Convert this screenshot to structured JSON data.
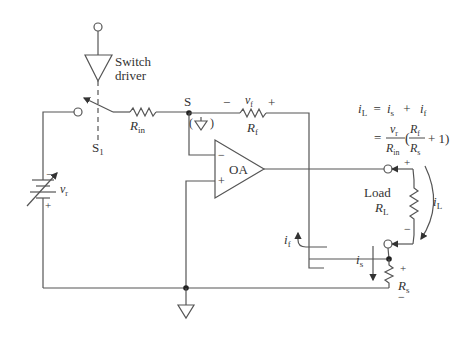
{
  "diagram": {
    "type": "circuit",
    "labels": {
      "switch_driver_line1": "Switch",
      "switch_driver_line2": "driver",
      "switch_name": "S",
      "switch_sub": "1",
      "rin": "R",
      "rin_sub": "in",
      "node_s": "S",
      "virtual_ground": "( ▽ )",
      "vf": "v",
      "vf_sub": "f",
      "vf_minus": "−",
      "vf_plus": "+",
      "rf": "R",
      "rf_sub": "f",
      "opamp": "OA",
      "opamp_minus": "−",
      "opamp_plus": "+",
      "source_v": "v",
      "source_sub": "r",
      "source_minus": "−",
      "source_plus": "+",
      "load_line1": "Load",
      "load_r": "R",
      "load_sub": "L",
      "load_plus": "+",
      "load_minus": "−",
      "il": "i",
      "il_sub": "L",
      "if": "i",
      "if_sub": "f",
      "is": "i",
      "is_sub": "s",
      "rs": "R",
      "rs_sub": "s",
      "rs_plus": "+",
      "rs_minus": "−"
    },
    "equations": {
      "line1": {
        "lhs": "i",
        "lhs_sub": "L",
        "eq": "=",
        "t1": "i",
        "t1_sub": "s",
        "plus": "+",
        "t2": "i",
        "t2_sub": "f"
      },
      "line2": {
        "eq": "=",
        "num1": "v",
        "num1_sub": "r",
        "den1": "R",
        "den1_sub": "in",
        "open": "(",
        "num2": "R",
        "num2_sub": "f",
        "den2": "R",
        "den2_sub": "s",
        "tail": "+ 1)"
      }
    }
  }
}
